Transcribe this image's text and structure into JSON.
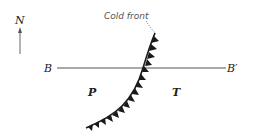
{
  "diagram": {
    "north_label": "N",
    "front_label": "Cold front",
    "section_start_label": "B",
    "section_end_label": "B′",
    "left_region_label": "P",
    "right_region_label": "T",
    "colors": {
      "front": "#1a1a1a",
      "section_line": "#555555",
      "text": "#222222",
      "arrow": "#666666"
    }
  }
}
